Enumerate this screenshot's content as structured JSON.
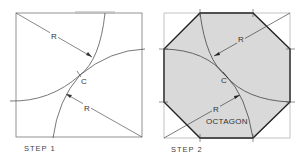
{
  "step1": {
    "caption": "STEP 1",
    "radius_label_top": "R",
    "radius_label_bottom": "R",
    "center_label": "C"
  },
  "step2": {
    "caption": "STEP 2",
    "radius_label_top": "R",
    "radius_label_bottom": "R",
    "center_label": "C",
    "shape_label": "OCTAGON",
    "fill_color": "#d9d9d9",
    "outline_color": "#222222"
  },
  "colors": {
    "line": "#555555",
    "light_line": "#999999"
  }
}
